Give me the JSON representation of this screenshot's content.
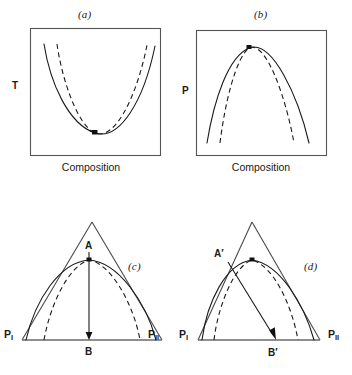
{
  "figure": {
    "panels": [
      {
        "id": "a",
        "caption": "(a)",
        "y_axis_label": "T",
        "x_axis_label": "Composition",
        "curves": [
          {
            "style": "solid",
            "shape": "minimum-azeotrope-liquidus"
          },
          {
            "style": "dashed",
            "shape": "minimum-azeotrope-vaporus"
          }
        ],
        "markers": [
          {
            "name": "azeotropic-point",
            "type": "square"
          }
        ]
      },
      {
        "id": "b",
        "caption": "(b)",
        "y_axis_label": "P",
        "x_axis_label": "Composition",
        "curves": [
          {
            "style": "solid",
            "shape": "maximum-azeotrope-liquidus"
          },
          {
            "style": "dashed",
            "shape": "maximum-azeotrope-vaporus"
          }
        ],
        "markers": [
          {
            "name": "azeotropic-point",
            "type": "square"
          }
        ]
      },
      {
        "id": "c",
        "caption": "(c)",
        "apex_label": "Solvent",
        "left_corner_label": "P",
        "left_corner_sub": "I",
        "right_corner_label": "P",
        "right_corner_sub": "II",
        "tie_line_top_label": "A",
        "tie_line_bottom_label": "B",
        "tie_line_direction": "vertical",
        "curves": [
          {
            "style": "solid",
            "shape": "binodal-outer"
          },
          {
            "style": "dashed",
            "shape": "binodal-inner"
          }
        ],
        "markers": [
          {
            "name": "plait-point",
            "type": "square"
          }
        ]
      },
      {
        "id": "d",
        "caption": "(d)",
        "apex_label": "M",
        "apex_sub": "II",
        "left_corner_label": "P",
        "left_corner_sub": "I",
        "right_corner_label": "P",
        "right_corner_sub": "II",
        "tie_line_top_label": "A′",
        "tie_line_bottom_label": "B′",
        "tie_line_direction": "slanted",
        "curves": [
          {
            "style": "solid",
            "shape": "binodal-outer"
          },
          {
            "style": "dashed",
            "shape": "binodal-inner"
          }
        ],
        "markers": [
          {
            "name": "plait-point",
            "type": "square"
          }
        ]
      }
    ]
  },
  "colors": {
    "ink": "#1a1a1a",
    "frame": "#555555",
    "triangle_edge": "#4a4a4a",
    "base_line": "#6a6a6a",
    "background": "#ffffff"
  }
}
